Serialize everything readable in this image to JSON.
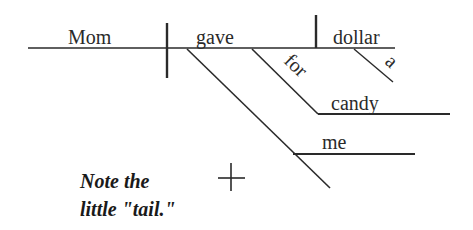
{
  "diagram": {
    "type": "sentence-diagram",
    "sentence_words": {
      "subject": "Mom",
      "verb": "gave",
      "direct_object": "dollar",
      "object_modifier": "a",
      "preposition": "for",
      "prepositional_object": "candy",
      "indirect_object": "me"
    },
    "note": {
      "line1": "Note the",
      "line2": "little \"tail.\""
    },
    "colors": {
      "ink": "#2a2a2a",
      "background": "#ffffff"
    }
  }
}
